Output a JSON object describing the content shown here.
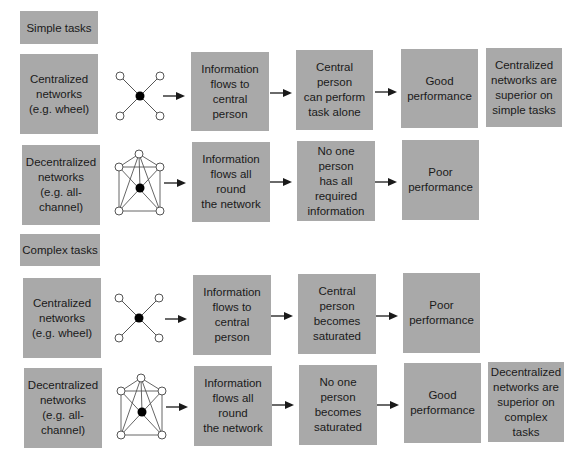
{
  "colors": {
    "box_fill": "#a9a9a9",
    "line": "#1a1a1a",
    "node_stroke": "#555555"
  },
  "sections": [
    {
      "label": "Simple tasks",
      "rows": [
        {
          "network": "Centralized\nnetworks\n(e.g. wheel)",
          "network_icon": "wheel-network-icon",
          "step1": "Information\nflows to central\nperson",
          "step2": "Central person\ncan perform\ntask alone",
          "outcome": "Good\nperformance",
          "conclusion": "Centralized\nnetworks are\nsuperior on\nsimple tasks"
        },
        {
          "network": "Decentralized\nnetworks\n(e.g. all-\nchannel)",
          "network_icon": "all-channel-network-icon",
          "step1": "Information\nflows all round\nthe network",
          "step2": "No one person\nhas all required\ninformation",
          "outcome": "Poor\nperformance"
        }
      ]
    },
    {
      "label": "Complex tasks",
      "rows": [
        {
          "network": "Centralized\nnetworks\n(e.g. wheel)",
          "network_icon": "wheel-network-icon",
          "step1": "Information\nflows to central\nperson",
          "step2": "Central person\nbecomes\nsaturated",
          "outcome": "Poor\nperformance"
        },
        {
          "network": "Decentralized\nnetworks\n(e.g. all-\nchannel)",
          "network_icon": "all-channel-network-icon",
          "step1": "Information\nflows all round\nthe network",
          "step2": "No one person\nbecomes\nsaturated",
          "outcome": "Good\nperformance",
          "conclusion": "Decentralized\nnetworks are\nsuperior on\ncomplex tasks"
        }
      ]
    }
  ]
}
